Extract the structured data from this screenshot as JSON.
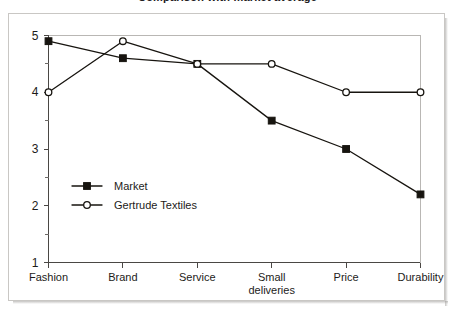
{
  "figure": {
    "title_sliver": "Comparison with market average",
    "background_color": "#ffffff",
    "frame_color": "#c9c7c4"
  },
  "chart_data": {
    "type": "line",
    "title": "",
    "xlabel": "",
    "ylabel": "",
    "categories": [
      "Fashion",
      "Brand",
      "Service",
      "Small deliveries",
      "Price",
      "Durability"
    ],
    "category_lines": [
      [
        "Fashion"
      ],
      [
        "Brand"
      ],
      [
        "Service"
      ],
      [
        "Small",
        "deliveries"
      ],
      [
        "Price"
      ],
      [
        "Durability"
      ]
    ],
    "series": [
      {
        "name": "Market",
        "marker": "filled-square",
        "color": "#17140f",
        "values": [
          4.9,
          4.6,
          4.5,
          3.5,
          3.0,
          2.2
        ]
      },
      {
        "name": "Gertrude Textiles",
        "marker": "open-circle",
        "color": "#17140f",
        "values": [
          4.0,
          4.9,
          4.5,
          4.5,
          4.0,
          4.0
        ]
      }
    ],
    "ylim": [
      1,
      5
    ],
    "y_major_ticks": [
      1,
      2,
      3,
      4,
      5
    ],
    "y_tick_labels": [
      "1",
      "2",
      "3",
      "4",
      "5"
    ],
    "y_minor_ticks": [
      1.5,
      2.5,
      3.5,
      4.5
    ],
    "grid": false,
    "legend_position": "inside-lower-left"
  },
  "legend": {
    "entries": [
      {
        "label": "Market",
        "marker": "filled-square"
      },
      {
        "label": "Gertrude Textiles",
        "marker": "open-circle"
      }
    ]
  }
}
